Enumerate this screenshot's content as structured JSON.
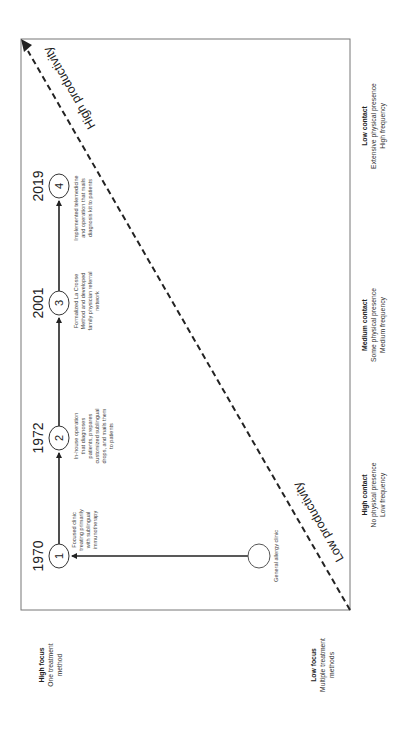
{
  "diagram": {
    "orientation": "rotated 90 degrees counter-clockwise",
    "colors": {
      "line": "#222222",
      "frame": "#777777",
      "text": "#333333",
      "background": "#ffffff"
    },
    "productivity_line": {
      "high_label": "High productivity",
      "low_label": "Low productivity",
      "style": "dashed",
      "arrowhead": "toward high productivity"
    },
    "contact_axis": [
      {
        "title": "High contact",
        "line1": "No physical presence",
        "line2": "Low frequency"
      },
      {
        "title": "Medium contact",
        "line1": "Some physical presence",
        "line2": "Medium frequency"
      },
      {
        "title": "Low contact",
        "line1": "Extensive physical presence",
        "line2": "High frequency"
      }
    ],
    "focus_axis": [
      {
        "title": "High focus",
        "line1": "One treatment",
        "line2": "method"
      },
      {
        "title": "Low focus",
        "line1": "Multiple treatment",
        "line2": "methods"
      }
    ],
    "origin_node": {
      "label": "General allergy clinic"
    },
    "milestones": [
      {
        "number": "1",
        "year": "1970",
        "desc": [
          "Focused clinic",
          "treating primarily",
          "with sublingual",
          "immunotherapy"
        ]
      },
      {
        "number": "2",
        "year": "1972",
        "desc": [
          "In-house operation",
          "that diagnoses",
          "patients, prepares",
          "customized sublingual",
          "drops, and mails them",
          "to patients"
        ]
      },
      {
        "number": "3",
        "year": "2001",
        "desc": [
          "Formalized La Crosse",
          "Method and developed",
          "family physician referral",
          "network"
        ]
      },
      {
        "number": "4",
        "year": "2019",
        "desc": [
          "Implemented telemedicine",
          "and operation that mails",
          "diagnosis kit to patients"
        ]
      }
    ]
  }
}
